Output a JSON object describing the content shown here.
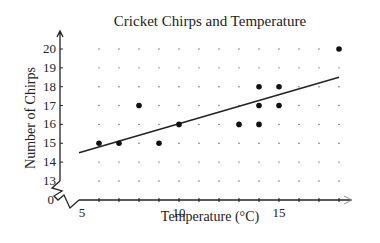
{
  "chart_data": {
    "type": "scatter",
    "title": "Cricket Chirps and Temperature",
    "xlabel": "Temperature (°C)",
    "ylabel": "Number of Chirps",
    "xlim": [
      5,
      18
    ],
    "ylim": [
      13,
      20
    ],
    "x_ticks": [
      5,
      10,
      15
    ],
    "y_ticks": [
      0,
      13,
      14,
      15,
      16,
      17,
      18,
      19,
      20
    ],
    "axis_break": {
      "x": true,
      "y": true
    },
    "grid": "dotted",
    "points": [
      {
        "x": 6,
        "y": 15
      },
      {
        "x": 7,
        "y": 15
      },
      {
        "x": 8,
        "y": 17
      },
      {
        "x": 9,
        "y": 15
      },
      {
        "x": 10,
        "y": 16
      },
      {
        "x": 13,
        "y": 16
      },
      {
        "x": 14,
        "y": 16
      },
      {
        "x": 14,
        "y": 17
      },
      {
        "x": 14,
        "y": 18
      },
      {
        "x": 15,
        "y": 17
      },
      {
        "x": 15,
        "y": 18
      },
      {
        "x": 18,
        "y": 20
      }
    ],
    "trend_line": {
      "x1": 5,
      "y1": 14.5,
      "x2": 18,
      "y2": 18.5
    }
  }
}
